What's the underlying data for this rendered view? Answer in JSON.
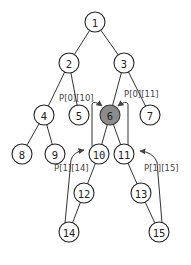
{
  "diagram": {
    "type": "tree",
    "highlighted_node": "6",
    "node_radius": 10,
    "nodes": [
      {
        "id": "1",
        "label": "1",
        "x": 95,
        "y": 22
      },
      {
        "id": "2",
        "label": "2",
        "x": 69,
        "y": 63
      },
      {
        "id": "3",
        "label": "3",
        "x": 124,
        "y": 63
      },
      {
        "id": "4",
        "label": "4",
        "x": 44,
        "y": 115
      },
      {
        "id": "5",
        "label": "5",
        "x": 79,
        "y": 115
      },
      {
        "id": "6",
        "label": "6",
        "x": 110,
        "y": 115
      },
      {
        "id": "7",
        "label": "7",
        "x": 150,
        "y": 115
      },
      {
        "id": "8",
        "label": "8",
        "x": 22,
        "y": 154
      },
      {
        "id": "9",
        "label": "9",
        "x": 55,
        "y": 154
      },
      {
        "id": "10",
        "label": "10",
        "x": 99,
        "y": 154
      },
      {
        "id": "11",
        "label": "11",
        "x": 124,
        "y": 154
      },
      {
        "id": "12",
        "label": "12",
        "x": 84,
        "y": 193
      },
      {
        "id": "13",
        "label": "13",
        "x": 141,
        "y": 193
      },
      {
        "id": "14",
        "label": "14",
        "x": 69,
        "y": 232
      },
      {
        "id": "15",
        "label": "15",
        "x": 159,
        "y": 232
      }
    ],
    "edges": [
      [
        "1",
        "2"
      ],
      [
        "1",
        "3"
      ],
      [
        "2",
        "4"
      ],
      [
        "2",
        "5"
      ],
      [
        "3",
        "6"
      ],
      [
        "3",
        "7"
      ],
      [
        "4",
        "8"
      ],
      [
        "4",
        "9"
      ],
      [
        "6",
        "10"
      ],
      [
        "6",
        "11"
      ],
      [
        "10",
        "12"
      ],
      [
        "11",
        "13"
      ],
      [
        "12",
        "14"
      ],
      [
        "13",
        "15"
      ]
    ],
    "pointers": [
      {
        "label": "P[0][10]",
        "from": "10",
        "to": "6"
      },
      {
        "label": "P[0][11]",
        "from": "11",
        "to": "6"
      },
      {
        "label": "P[1][14]",
        "from": "14",
        "to": "10"
      },
      {
        "label": "P[1][15]",
        "from": "15",
        "to": "11"
      }
    ],
    "colors": {
      "highlight_fill": "#8c8c8c",
      "stroke": "#222222",
      "background": "#ffffff"
    }
  }
}
